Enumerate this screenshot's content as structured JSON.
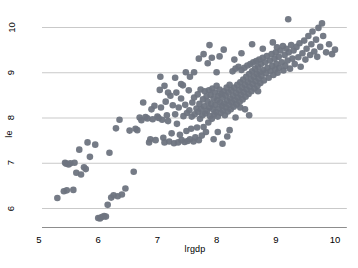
{
  "chart_data": {
    "type": "scatter",
    "title": "",
    "subtitle": "",
    "xlabel": "lrgdp",
    "ylabel": "le",
    "xlim": [
      4.78,
      10.2
    ],
    "ylim": [
      5.58,
      10.35
    ],
    "xticks": [
      5,
      6,
      7,
      8,
      9,
      10
    ],
    "yticks": [
      6,
      7,
      8,
      9,
      10
    ],
    "xtick_labels": [
      "5",
      "6",
      "7",
      "8",
      "9",
      "10"
    ],
    "ytick_labels": [
      "6",
      "7",
      "8",
      "9",
      "10"
    ],
    "grid": "horizontal",
    "legend": "none",
    "marker": {
      "shape": "circle",
      "color": "#6e7480",
      "size_px": 3.3,
      "opacity": 0.95
    },
    "axis_color": "#8d8d8d",
    "grid_color": "#c9c9c9",
    "background": "#ffffff",
    "n_points": 276,
    "series": [
      {
        "name": "le vs lrgdp",
        "points": [
          [
            5.31,
            6.22
          ],
          [
            5.42,
            6.37
          ],
          [
            5.44,
            7.0
          ],
          [
            5.46,
            6.98
          ],
          [
            5.47,
            6.39
          ],
          [
            5.5,
            6.96
          ],
          [
            5.53,
            6.99
          ],
          [
            5.58,
            6.4
          ],
          [
            5.6,
            7.0
          ],
          [
            5.63,
            6.78
          ],
          [
            5.68,
            7.29
          ],
          [
            5.71,
            6.74
          ],
          [
            5.76,
            6.9
          ],
          [
            5.79,
            6.86
          ],
          [
            5.82,
            7.45
          ],
          [
            5.86,
            7.13
          ],
          [
            5.95,
            7.4
          ],
          [
            6.0,
            5.78
          ],
          [
            6.03,
            5.77
          ],
          [
            6.06,
            5.8
          ],
          [
            6.1,
            5.82
          ],
          [
            6.13,
            5.81
          ],
          [
            6.16,
            6.07
          ],
          [
            6.19,
            7.22
          ],
          [
            6.22,
            6.23
          ],
          [
            6.26,
            6.28
          ],
          [
            6.3,
            7.76
          ],
          [
            6.33,
            6.26
          ],
          [
            6.36,
            7.95
          ],
          [
            6.4,
            6.3
          ],
          [
            6.46,
            6.43
          ],
          [
            6.53,
            7.71
          ],
          [
            6.6,
            6.8
          ],
          [
            6.63,
            7.75
          ],
          [
            6.66,
            7.72
          ],
          [
            6.7,
            8.0
          ],
          [
            6.73,
            7.94
          ],
          [
            6.76,
            8.33
          ],
          [
            6.8,
            8.01
          ],
          [
            6.83,
            7.98
          ],
          [
            6.86,
            7.45
          ],
          [
            6.88,
            7.52
          ],
          [
            6.9,
            8.18
          ],
          [
            6.92,
            7.96
          ],
          [
            6.95,
            8.26
          ],
          [
            6.97,
            7.5
          ],
          [
            7.0,
            8.02
          ],
          [
            7.02,
            7.99
          ],
          [
            7.04,
            8.61
          ],
          [
            7.06,
            8.22
          ],
          [
            7.08,
            7.95
          ],
          [
            7.1,
            7.55
          ],
          [
            7.12,
            7.45
          ],
          [
            7.14,
            8.35
          ],
          [
            7.16,
            8.05
          ],
          [
            7.18,
            7.92
          ],
          [
            7.2,
            7.47
          ],
          [
            7.22,
            8.48
          ],
          [
            7.24,
            7.65
          ],
          [
            7.26,
            8.27
          ],
          [
            7.28,
            7.43
          ],
          [
            7.3,
            8.07
          ],
          [
            7.32,
            8.55
          ],
          [
            7.33,
            7.86
          ],
          [
            7.35,
            7.45
          ],
          [
            7.36,
            8.22
          ],
          [
            7.38,
            7.62
          ],
          [
            7.4,
            8.42
          ],
          [
            7.41,
            7.5
          ],
          [
            7.43,
            8.71
          ],
          [
            7.44,
            8.03
          ],
          [
            7.46,
            7.46
          ],
          [
            7.47,
            8.28
          ],
          [
            7.49,
            7.7
          ],
          [
            7.5,
            8.1
          ],
          [
            7.51,
            7.48
          ],
          [
            7.53,
            8.6
          ],
          [
            7.54,
            8.16
          ],
          [
            7.55,
            7.52
          ],
          [
            7.57,
            7.75
          ],
          [
            7.58,
            8.02
          ],
          [
            7.59,
            8.33
          ],
          [
            7.61,
            7.47
          ],
          [
            7.62,
            8.44
          ],
          [
            7.63,
            8.07
          ],
          [
            7.64,
            7.56
          ],
          [
            7.66,
            8.2
          ],
          [
            7.67,
            7.78
          ],
          [
            7.68,
            8.51
          ],
          [
            7.69,
            8.12
          ],
          [
            7.7,
            7.5
          ],
          [
            7.71,
            8.3
          ],
          [
            7.72,
            7.97
          ],
          [
            7.73,
            8.62
          ],
          [
            7.74,
            8.18
          ],
          [
            7.75,
            7.6
          ],
          [
            7.76,
            8.05
          ],
          [
            7.77,
            8.4
          ],
          [
            7.78,
            7.79
          ],
          [
            7.79,
            8.25
          ],
          [
            7.8,
            8.58
          ],
          [
            7.81,
            8.09
          ],
          [
            7.82,
            7.68
          ],
          [
            7.83,
            8.47
          ],
          [
            7.84,
            8.15
          ],
          [
            7.85,
            8.35
          ],
          [
            7.86,
            7.89
          ],
          [
            7.87,
            8.6
          ],
          [
            7.88,
            8.22
          ],
          [
            7.89,
            8.03
          ],
          [
            7.9,
            8.5
          ],
          [
            7.91,
            8.3
          ],
          [
            7.92,
            7.97
          ],
          [
            7.93,
            8.64
          ],
          [
            7.94,
            8.18
          ],
          [
            7.95,
            8.42
          ],
          [
            7.96,
            8.07
          ],
          [
            7.97,
            8.55
          ],
          [
            7.98,
            8.28
          ],
          [
            7.99,
            8.12
          ],
          [
            8.0,
            8.7
          ],
          [
            8.0,
            9.0
          ],
          [
            8.01,
            8.38
          ],
          [
            8.02,
            8.02
          ],
          [
            8.03,
            8.48
          ],
          [
            8.04,
            8.2
          ],
          [
            8.05,
            8.62
          ],
          [
            8.06,
            8.33
          ],
          [
            8.07,
            8.1
          ],
          [
            8.08,
            8.52
          ],
          [
            8.09,
            8.26
          ],
          [
            8.1,
            8.44
          ],
          [
            8.11,
            8.15
          ],
          [
            8.12,
            8.58
          ],
          [
            8.13,
            8.31
          ],
          [
            8.14,
            8.05
          ],
          [
            8.15,
            8.49
          ],
          [
            8.16,
            8.22
          ],
          [
            8.17,
            8.66
          ],
          [
            8.18,
            8.37
          ],
          [
            8.19,
            8.13
          ],
          [
            8.2,
            8.55
          ],
          [
            8.21,
            8.28
          ],
          [
            8.22,
            8.72
          ],
          [
            8.23,
            8.42
          ],
          [
            8.24,
            8.18
          ],
          [
            8.25,
            8.6
          ],
          [
            8.26,
            8.33
          ],
          [
            8.27,
            9.02
          ],
          [
            8.28,
            8.48
          ],
          [
            8.29,
            8.24
          ],
          [
            8.3,
            8.66
          ],
          [
            8.31,
            8.38
          ],
          [
            8.32,
            9.08
          ],
          [
            8.33,
            8.54
          ],
          [
            8.34,
            8.29
          ],
          [
            8.35,
            8.72
          ],
          [
            8.36,
            8.44
          ],
          [
            8.37,
            9.12
          ],
          [
            8.38,
            8.6
          ],
          [
            8.39,
            8.35
          ],
          [
            8.4,
            8.78
          ],
          [
            8.41,
            8.5
          ],
          [
            8.42,
            9.05
          ],
          [
            8.43,
            8.66
          ],
          [
            8.44,
            8.4
          ],
          [
            8.45,
            8.84
          ],
          [
            8.46,
            8.56
          ],
          [
            8.47,
            9.1
          ],
          [
            8.48,
            8.72
          ],
          [
            8.49,
            8.46
          ],
          [
            8.5,
            8.9
          ],
          [
            8.51,
            8.62
          ],
          [
            8.52,
            9.15
          ],
          [
            8.53,
            8.78
          ],
          [
            8.54,
            8.52
          ],
          [
            8.55,
            8.96
          ],
          [
            8.56,
            8.68
          ],
          [
            8.57,
            9.18
          ],
          [
            8.58,
            8.84
          ],
          [
            8.59,
            8.58
          ],
          [
            8.6,
            9.02
          ],
          [
            8.61,
            8.74
          ],
          [
            8.62,
            9.22
          ],
          [
            8.63,
            8.9
          ],
          [
            8.64,
            8.64
          ],
          [
            8.65,
            9.08
          ],
          [
            8.66,
            8.8
          ],
          [
            8.67,
            9.25
          ],
          [
            8.68,
            8.96
          ],
          [
            8.69,
            8.7
          ],
          [
            8.7,
            9.12
          ],
          [
            8.71,
            8.86
          ],
          [
            8.72,
            9.28
          ],
          [
            8.73,
            9.0
          ],
          [
            8.74,
            8.76
          ],
          [
            8.75,
            9.18
          ],
          [
            8.76,
            8.92
          ],
          [
            8.78,
            9.32
          ],
          [
            8.79,
            9.05
          ],
          [
            8.8,
            8.82
          ],
          [
            8.82,
            9.22
          ],
          [
            8.83,
            8.98
          ],
          [
            8.85,
            9.36
          ],
          [
            8.86,
            9.1
          ],
          [
            8.88,
            8.88
          ],
          [
            8.9,
            9.26
          ],
          [
            8.91,
            9.02
          ],
          [
            8.93,
            9.4
          ],
          [
            8.94,
            9.14
          ],
          [
            8.96,
            8.94
          ],
          [
            8.98,
            9.3
          ],
          [
            8.99,
            9.06
          ],
          [
            9.0,
            9.44
          ],
          [
            9.01,
            9.18
          ],
          [
            9.02,
            9.55
          ],
          [
            9.03,
            8.99
          ],
          [
            9.05,
            9.34
          ],
          [
            9.06,
            9.1
          ],
          [
            9.08,
            9.48
          ],
          [
            9.1,
            9.22
          ],
          [
            9.12,
            9.58
          ],
          [
            9.13,
            9.04
          ],
          [
            9.15,
            9.38
          ],
          [
            9.16,
            9.14
          ],
          [
            9.18,
            9.52
          ],
          [
            9.2,
            9.26
          ],
          [
            9.21,
            10.17
          ],
          [
            9.22,
            9.44
          ],
          [
            9.24,
            9.08
          ],
          [
            9.26,
            9.6
          ],
          [
            9.28,
            9.3
          ],
          [
            9.3,
            9.48
          ],
          [
            9.32,
            9.18
          ],
          [
            9.35,
            9.56
          ],
          [
            9.38,
            9.33
          ],
          [
            9.4,
            9.64
          ],
          [
            9.42,
            9.12
          ],
          [
            9.45,
            9.42
          ],
          [
            9.48,
            9.7
          ],
          [
            9.5,
            9.28
          ],
          [
            9.52,
            9.52
          ],
          [
            9.55,
            9.8
          ],
          [
            9.58,
            9.38
          ],
          [
            9.6,
            9.62
          ],
          [
            9.62,
            9.9
          ],
          [
            9.65,
            9.46
          ],
          [
            9.68,
            9.72
          ],
          [
            9.7,
            9.34
          ],
          [
            9.72,
            9.98
          ],
          [
            9.75,
            9.56
          ],
          [
            9.78,
            10.08
          ],
          [
            9.8,
            9.8
          ],
          [
            9.85,
            9.44
          ],
          [
            9.9,
            9.62
          ],
          [
            9.95,
            9.4
          ],
          [
            10.0,
            9.5
          ],
          [
            7.05,
            8.9
          ],
          [
            7.12,
            8.7
          ],
          [
            7.3,
            8.88
          ],
          [
            7.4,
            8.74
          ],
          [
            7.55,
            8.9
          ],
          [
            7.62,
            9.0
          ],
          [
            7.7,
            9.3
          ],
          [
            7.78,
            9.4
          ],
          [
            7.85,
            9.2
          ],
          [
            7.92,
            9.32
          ],
          [
            7.48,
            9.0
          ],
          [
            7.18,
            8.55
          ],
          [
            7.88,
            9.6
          ],
          [
            8.05,
            9.35
          ],
          [
            8.12,
            9.5
          ],
          [
            8.3,
            9.28
          ],
          [
            8.42,
            9.42
          ],
          [
            8.6,
            9.62
          ],
          [
            8.78,
            9.52
          ],
          [
            8.95,
            9.66
          ],
          [
            8.22,
            7.72
          ],
          [
            8.32,
            8.0
          ],
          [
            8.4,
            8.22
          ],
          [
            8.55,
            8.05
          ],
          [
            8.1,
            7.42
          ],
          [
            8.18,
            7.58
          ],
          [
            8.02,
            7.68
          ],
          [
            7.95,
            7.52
          ],
          [
            8.48,
            8.18
          ],
          [
            8.7,
            8.58
          ]
        ]
      }
    ]
  },
  "axes": {
    "x_title": "lrgdp",
    "y_title": "le"
  }
}
